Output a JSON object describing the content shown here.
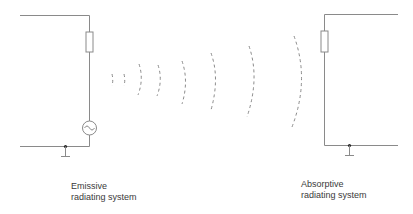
{
  "diagram": {
    "type": "radiating systems illustration",
    "line_color": "#8a8a8a",
    "emitter": {
      "label_line1": "Emissive",
      "label_line2": "radiating system",
      "components": [
        "resistor-icon",
        "ac-source-icon",
        "ground-icon"
      ]
    },
    "receiver": {
      "label_line1": "Absorptive",
      "label_line2": "radiating system",
      "components": [
        "resistor-icon",
        "ground-icon"
      ]
    },
    "wavefronts": {
      "count": 8,
      "style": "dashed arcs",
      "direction": "left-to-right, expanding"
    }
  }
}
